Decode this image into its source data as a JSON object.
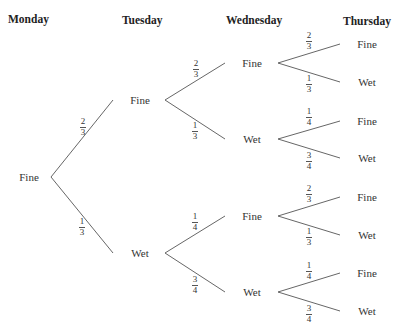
{
  "headers": {
    "monday": "Monday",
    "tuesday": "Tuesday",
    "wednesday": "Wednesday",
    "thursday": "Thursday"
  },
  "tree": {
    "root": {
      "label": "Fine",
      "x": 29,
      "y": 177
    },
    "tuesday": [
      {
        "label": "Fine",
        "x": 140,
        "y": 100,
        "prob": {
          "num": "2",
          "den": "3"
        }
      },
      {
        "label": "Wet",
        "x": 140,
        "y": 253,
        "prob": {
          "num": "1",
          "den": "3"
        }
      }
    ],
    "wednesday": [
      {
        "label": "Fine",
        "x": 252,
        "y": 63,
        "prob": {
          "num": "2",
          "den": "3"
        }
      },
      {
        "label": "Wet",
        "x": 252,
        "y": 139,
        "prob": {
          "num": "1",
          "den": "3"
        }
      },
      {
        "label": "Fine",
        "x": 252,
        "y": 216,
        "prob": {
          "num": "1",
          "den": "4"
        }
      },
      {
        "label": "Wet",
        "x": 252,
        "y": 292,
        "prob": {
          "num": "3",
          "den": "4"
        }
      }
    ],
    "thursday": [
      {
        "label": "Fine",
        "x": 367,
        "y": 44,
        "prob": {
          "num": "2",
          "den": "3"
        }
      },
      {
        "label": "Wet",
        "x": 367,
        "y": 82,
        "prob": {
          "num": "1",
          "den": "3"
        }
      },
      {
        "label": "Fine",
        "x": 367,
        "y": 121,
        "prob": {
          "num": "1",
          "den": "4"
        }
      },
      {
        "label": "Wet",
        "x": 367,
        "y": 158,
        "prob": {
          "num": "3",
          "den": "4"
        }
      },
      {
        "label": "Fine",
        "x": 367,
        "y": 197,
        "prob": {
          "num": "2",
          "den": "3"
        }
      },
      {
        "label": "Wet",
        "x": 367,
        "y": 235,
        "prob": {
          "num": "1",
          "den": "3"
        }
      },
      {
        "label": "Fine",
        "x": 367,
        "y": 273,
        "prob": {
          "num": "1",
          "den": "4"
        }
      },
      {
        "label": "Wet",
        "x": 367,
        "y": 311,
        "prob": {
          "num": "3",
          "den": "4"
        }
      }
    ]
  },
  "colors": {
    "line": "#555555",
    "text": "#333333"
  }
}
